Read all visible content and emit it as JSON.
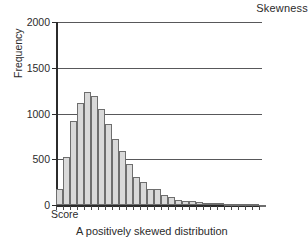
{
  "chart_data": {
    "type": "bar",
    "title": "Skewness",
    "xlabel": "Score",
    "ylabel": "Frequency",
    "caption": "A positively skewed distribution",
    "ylim": [
      0,
      2000
    ],
    "ytick_labels": [
      "0",
      "500",
      "1000",
      "1500",
      "2000"
    ],
    "ytick_values": [
      0,
      500,
      1000,
      1500,
      2000
    ],
    "grid": true,
    "legend": "none",
    "bar_fill_color": "#d9d9d9",
    "bar_edge_color": "#6e6e6e",
    "axis_color": "#2b2b2b",
    "grid_color": "#58585a",
    "categories": [
      "1",
      "2",
      "3",
      "4",
      "5",
      "6",
      "7",
      "8",
      "9",
      "10",
      "11",
      "12",
      "13",
      "14",
      "15",
      "16",
      "17",
      "18",
      "19",
      "20",
      "21",
      "22",
      "23",
      "24",
      "25",
      "26",
      "27",
      "28",
      "29",
      "30"
    ],
    "values": [
      180,
      520,
      920,
      1120,
      1230,
      1190,
      1050,
      880,
      720,
      590,
      450,
      310,
      250,
      180,
      175,
      110,
      85,
      50,
      45,
      40,
      30,
      25,
      20,
      18,
      15,
      12,
      10,
      8,
      6,
      5
    ]
  }
}
